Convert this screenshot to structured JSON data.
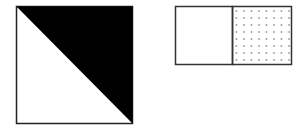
{
  "figures": [
    {
      "name": "diagonal-split-square",
      "description": "Square split by diagonal from top-left to bottom-right; upper-right triangle filled black, lower-left triangle white",
      "fill_color": "#000000",
      "outline_color": "#222222"
    },
    {
      "name": "two-part-rectangle",
      "description": "Rectangle divided vertically into two equal halves; left half blank, right half dotted pattern",
      "left_fill": "#ffffff",
      "right_pattern": "dots",
      "dot_color": "#555555",
      "outline_color": "#333333"
    }
  ]
}
